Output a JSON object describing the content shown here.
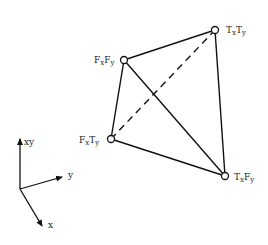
{
  "diagram": {
    "type": "tetrahedron-lattice",
    "nodes": [
      {
        "id": "TxTy",
        "main1": "T",
        "sub1": "x",
        "main2": "T",
        "sub2": "y",
        "x": 215,
        "y": 30
      },
      {
        "id": "FxFy",
        "main1": "F",
        "sub1": "x",
        "main2": "F",
        "sub2": "y",
        "x": 124,
        "y": 60
      },
      {
        "id": "FxTy",
        "main1": "F",
        "sub1": "x",
        "main2": "T",
        "sub2": "y",
        "x": 111,
        "y": 139
      },
      {
        "id": "TxFy",
        "main1": "T",
        "sub1": "x",
        "main2": "F",
        "sub2": "y",
        "x": 225,
        "y": 176
      }
    ],
    "edges": [
      {
        "from": "FxFy",
        "to": "TxTy",
        "style": "solid"
      },
      {
        "from": "TxTy",
        "to": "TxFy",
        "style": "solid"
      },
      {
        "from": "FxFy",
        "to": "FxTy",
        "style": "solid"
      },
      {
        "from": "FxTy",
        "to": "TxFy",
        "style": "solid"
      },
      {
        "from": "FxFy",
        "to": "TxFy",
        "style": "solid"
      },
      {
        "from": "FxTy",
        "to": "TxTy",
        "style": "dashed"
      }
    ],
    "axes": {
      "origin": {
        "x": 20,
        "y": 189
      },
      "labels": {
        "xy": "xy",
        "y": "y",
        "x": "x"
      }
    }
  }
}
